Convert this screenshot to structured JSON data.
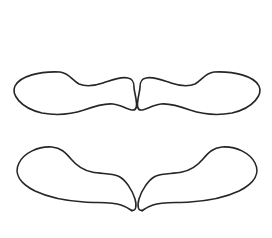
{
  "figure": {
    "title": "Four shoe sole outlines",
    "background_color": "#ffffff",
    "stroke_color": "#262626",
    "stroke_width": 1.6,
    "canvas": {
      "width": 272,
      "height": 238
    },
    "shapes": [
      {
        "id": "upper-left-sole",
        "label": "Upper left shoe sole",
        "orientation": "horizontal",
        "toe_direction": "right",
        "heel_direction": "left",
        "rotation_deg": 0,
        "bounds": {
          "x": 13,
          "y": 71,
          "width": 124,
          "height": 45
        }
      },
      {
        "id": "upper-right-sole",
        "label": "Upper right shoe sole",
        "orientation": "horizontal",
        "toe_direction": "left",
        "heel_direction": "right",
        "rotation_deg": 0,
        "bounds": {
          "x": 137,
          "y": 71,
          "width": 124,
          "height": 45
        }
      },
      {
        "id": "lower-left-sole",
        "label": "Lower left shoe sole",
        "orientation": "angled",
        "toe_direction": "down-right",
        "heel_direction": "up-left",
        "rotation_deg": 22,
        "bounds": {
          "x": 16,
          "y": 146,
          "width": 120,
          "height": 68
        }
      },
      {
        "id": "lower-right-sole",
        "label": "Lower right shoe sole",
        "orientation": "angled",
        "toe_direction": "down-left",
        "heel_direction": "up-right",
        "rotation_deg": -22,
        "bounds": {
          "x": 138,
          "y": 146,
          "width": 120,
          "height": 68
        }
      }
    ]
  }
}
